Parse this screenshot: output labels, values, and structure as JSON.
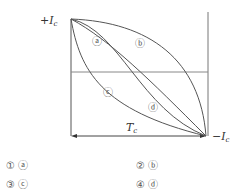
{
  "diagram": {
    "y_top_label": "+I",
    "y_top_sub": "c",
    "y_bottom_label": "−I",
    "y_bottom_sub": "c",
    "x_label": "T",
    "x_sub": "c",
    "curves": [
      {
        "id": "a",
        "label": "ⓐ"
      },
      {
        "id": "b",
        "label": "ⓑ"
      },
      {
        "id": "c",
        "label": "ⓒ"
      },
      {
        "id": "d",
        "label": "ⓓ"
      }
    ]
  },
  "options": [
    {
      "num": "①",
      "answer": "ⓐ"
    },
    {
      "num": "②",
      "answer": "ⓑ"
    },
    {
      "num": "③",
      "answer": "ⓒ"
    },
    {
      "num": "④",
      "answer": "ⓓ"
    }
  ]
}
